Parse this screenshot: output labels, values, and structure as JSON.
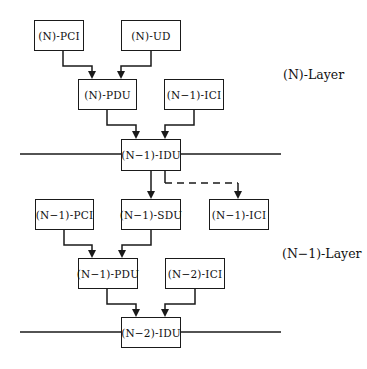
{
  "diagram": {
    "type": "layered protocol data unit diagram",
    "layers": [
      {
        "id": "n",
        "label": "(N)-Layer"
      },
      {
        "id": "n-1",
        "label": "(N−1)-Layer"
      }
    ],
    "boxes": {
      "n_pci": "(N)-PCI",
      "n_ud": "(N)-UD",
      "n_pdu": "(N)-PDU",
      "n1_ici_top": "(N−1)-ICI",
      "n1_idu": "(N−1)-IDU",
      "n1_pci": "(N−1)-PCI",
      "n1_sdu": "(N−1)-SDU",
      "n1_ici_bottom": "(N−1)-ICI",
      "n1_pdu": "(N−1)-PDU",
      "n2_ici": "(N−2)-ICI",
      "n2_idu": "(N−2)-IDU"
    },
    "edges": [
      {
        "from": "(N)-PCI",
        "to": "(N)-PDU",
        "style": "solid"
      },
      {
        "from": "(N)-UD",
        "to": "(N)-PDU",
        "style": "solid"
      },
      {
        "from": "(N)-PDU",
        "to": "(N−1)-IDU",
        "style": "solid"
      },
      {
        "from": "(N−1)-ICI",
        "to": "(N−1)-IDU",
        "style": "solid"
      },
      {
        "from": "(N−1)-IDU",
        "to": "(N−1)-SDU",
        "style": "solid"
      },
      {
        "from": "(N−1)-IDU",
        "to": "(N−1)-ICI",
        "style": "dashed"
      },
      {
        "from": "(N−1)-PCI",
        "to": "(N−1)-PDU",
        "style": "solid"
      },
      {
        "from": "(N−1)-SDU",
        "to": "(N−1)-PDU",
        "style": "solid"
      },
      {
        "from": "(N−1)-PDU",
        "to": "(N−2)-IDU",
        "style": "solid"
      },
      {
        "from": "(N−2)-ICI",
        "to": "(N−2)-IDU",
        "style": "solid"
      }
    ],
    "colors": {
      "line": "#1a1a1a",
      "background": "#ffffff"
    }
  }
}
